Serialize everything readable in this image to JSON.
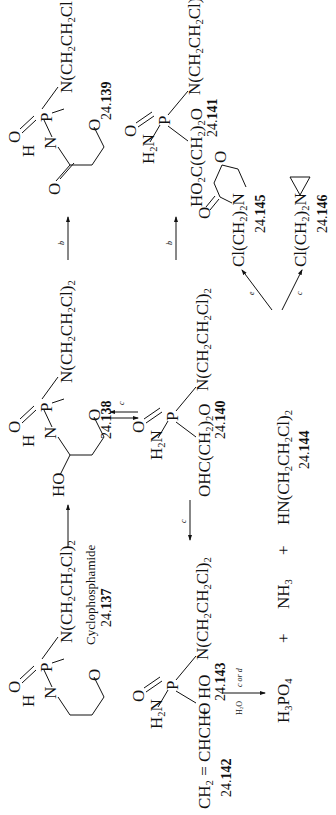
{
  "orientation": "rotated -90deg (landscape scheme shown in portrait)",
  "compounds": {
    "c137": {
      "id_prefix": "24.",
      "id_num": "137",
      "name": "Cyclophosphamide",
      "ring_atoms": {
        "nh": "H",
        "n": "N",
        "p": "P",
        "o_ring": "O",
        "o_double": "O"
      },
      "substituent": "N(CH2CH2Cl)2"
    },
    "c138": {
      "id_prefix": "24.",
      "id_num": "138",
      "ring_atoms": {
        "ho": "HO",
        "nh": "H",
        "n": "N",
        "p": "P",
        "o_ring": "O",
        "o_double": "O"
      },
      "substituent": "N(CH2CH2Cl)2"
    },
    "c139": {
      "id_prefix": "24.",
      "id_num": "139",
      "ring_atoms": {
        "o_keto": "O",
        "nh": "H",
        "n": "N",
        "p": "P",
        "o_ring": "O",
        "o_double": "O"
      },
      "substituent": "N(CH2CH2Cl"
    },
    "c140": {
      "id_prefix": "24.",
      "id_num": "140",
      "left": "OHC(CH2)2O",
      "amine": "H2N",
      "p": "P",
      "o_double": "O",
      "substituent": "N(CH2CH2Cl)2"
    },
    "c141": {
      "id_prefix": "24.",
      "id_num": "141",
      "left": "HO2C(CH2)2O",
      "amine": "H2N",
      "p": "P",
      "o_double": "O",
      "substituent": "N(CH2CH2Cl)2"
    },
    "c142": {
      "id_prefix": "24.",
      "id_num": "142",
      "formula": "CH2=CHCHO"
    },
    "c143": {
      "id_prefix": "24.",
      "id_num": "143",
      "left": "HO",
      "amine": "H2N",
      "p": "P",
      "o_double": "O",
      "substituent": "N(CH2CH2Cl)2"
    },
    "c144": {
      "id_prefix": "24.",
      "id_num": "144",
      "formula": "HN(CH2CH2Cl)2"
    },
    "c145": {
      "id_prefix": "24.",
      "id_num": "145",
      "formula": "Cl(CH2)2N",
      "ring_atoms": {
        "o_keto": "O",
        "o_ring": "O"
      }
    },
    "c146": {
      "id_prefix": "24.",
      "id_num": "146",
      "formula": "Cl(CH2)2N"
    },
    "h3po4": "H3PO4",
    "nh3": "NH3"
  },
  "operators": {
    "plus": "+"
  },
  "reactions": [
    {
      "from": "24.137",
      "to": "24.138",
      "condition": ""
    },
    {
      "from": "24.138",
      "to": "24.139",
      "condition": "b"
    },
    {
      "from": "24.138",
      "to": "24.140",
      "condition": "c",
      "type": "equilibrium"
    },
    {
      "from": "24.140",
      "to": "24.141",
      "condition": "b"
    },
    {
      "from": "24.140",
      "to": "24.142 + 24.143",
      "condition": "c"
    },
    {
      "from": "24.143",
      "to": "H3PO4 + NH3 + 24.144",
      "condition_top": "H2O",
      "condition_bottom": "c or d"
    },
    {
      "from": "24.144",
      "to": "24.145",
      "condition": "e"
    },
    {
      "from": "24.144",
      "to": "24.146",
      "condition": "c"
    }
  ],
  "conditions": {
    "arrow_137_138": "",
    "arrow_138_139": "b",
    "arrow_138_140": "c",
    "arrow_140_141": "b",
    "arrow_140_143": "c",
    "arrow_143_products_top": "H2O",
    "arrow_143_products_bottom": "c or d",
    "arrow_144_145": "e",
    "arrow_144_146": "c"
  }
}
